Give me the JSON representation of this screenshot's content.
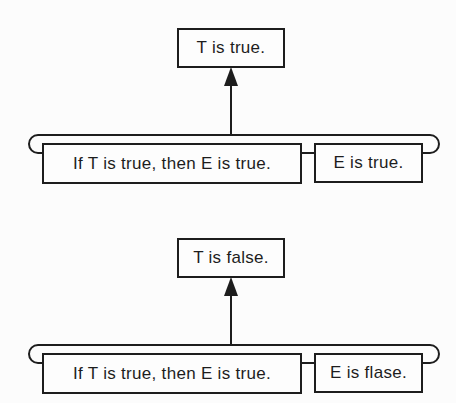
{
  "colors": {
    "ink": "#1d1d1d",
    "paper": "#fcfcfc",
    "box_fill": "#fdfdfd"
  },
  "diagrams": [
    {
      "conclusion": "T is true.",
      "premises": [
        "If T is true, then E is true.",
        "E is true."
      ]
    },
    {
      "conclusion": "T is false.",
      "premises": [
        "If T is true, then E is true.",
        "E is flase."
      ]
    }
  ]
}
